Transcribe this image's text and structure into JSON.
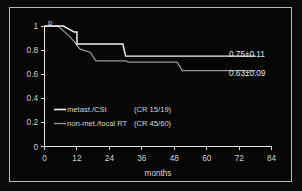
{
  "chart_data": {
    "type": "line",
    "title": "",
    "subtitle": "",
    "xlabel": "months",
    "ylabel": "p",
    "xlim": [
      0,
      84
    ],
    "ylim": [
      0,
      1
    ],
    "grid": false,
    "legend_position": "inside-lower-left",
    "x_ticks": [
      "0",
      "12",
      "24",
      "36",
      "48",
      "60",
      "72",
      "84"
    ],
    "x_tick_values": [
      0,
      12,
      24,
      36,
      48,
      60,
      72,
      84
    ],
    "y_ticks": [
      "0",
      "0.2",
      "0.4",
      "0.6",
      "0.8",
      "1"
    ],
    "y_tick_values": [
      0,
      0.2,
      0.4,
      0.6,
      0.8,
      1
    ],
    "series": [
      {
        "name": "metast./CSI",
        "detail": "(CR 15/19)",
        "color": "#f4f4f4",
        "final_label": "0.75±0.11",
        "final_value": 0.75,
        "final_error": 0.11,
        "steps": [
          {
            "x": 0,
            "y": 1.0
          },
          {
            "x": 7,
            "y": 1.0
          },
          {
            "x": 11,
            "y": 0.95
          },
          {
            "x": 12,
            "y": 0.95
          },
          {
            "x": 12,
            "y": 0.85
          },
          {
            "x": 29,
            "y": 0.85
          },
          {
            "x": 30,
            "y": 0.75
          },
          {
            "x": 78,
            "y": 0.75
          }
        ]
      },
      {
        "name": "non-met./focal RT",
        "detail": "(CR 45/60)",
        "color": "#9b9b9b",
        "final_label": "0.63±0.09",
        "final_value": 0.63,
        "final_error": 0.09,
        "steps": [
          {
            "x": 0,
            "y": 1.0
          },
          {
            "x": 5,
            "y": 1.0
          },
          {
            "x": 9,
            "y": 0.92
          },
          {
            "x": 11,
            "y": 0.87
          },
          {
            "x": 13,
            "y": 0.81
          },
          {
            "x": 17,
            "y": 0.78
          },
          {
            "x": 19,
            "y": 0.71
          },
          {
            "x": 30,
            "y": 0.71
          },
          {
            "x": 31,
            "y": 0.7
          },
          {
            "x": 49,
            "y": 0.7
          },
          {
            "x": 51,
            "y": 0.63
          },
          {
            "x": 78,
            "y": 0.63
          }
        ]
      }
    ]
  },
  "axes": {
    "y_axis_title": "p",
    "x_axis_title": "months"
  },
  "legend": {
    "entries": [
      {
        "label": "metast./CSI",
        "detail": "(CR 15/19)"
      },
      {
        "label": "non-met./focal RT",
        "detail": "(CR 45/60)"
      }
    ]
  },
  "annotations": [
    {
      "text": "0.75±0.11"
    },
    {
      "text": "0.63±0.09"
    }
  ],
  "colors": {
    "background": "#060606",
    "frame_border": "#b9b9b9",
    "axis": "#e8e8e8",
    "series_upper": "#f4f4f4",
    "series_lower": "#9b9b9b",
    "text": "#d8d8d8"
  }
}
